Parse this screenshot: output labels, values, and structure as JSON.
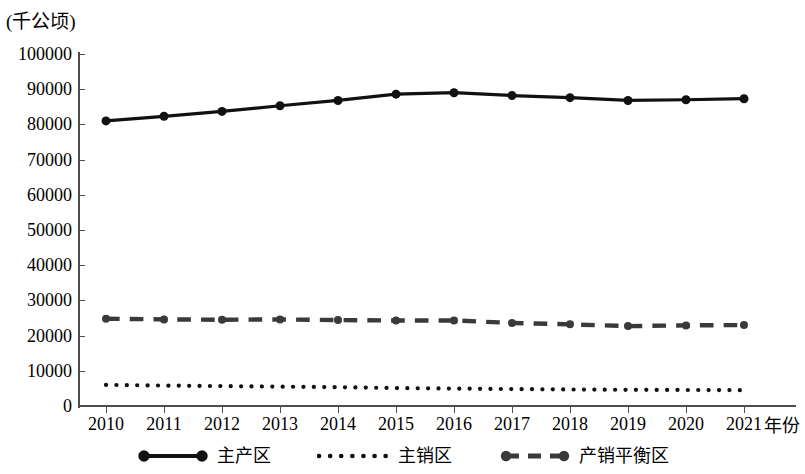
{
  "chart_data": {
    "type": "line",
    "title": "",
    "subtitle": "",
    "ylabel": "(千公顷)",
    "xlabel": "年份",
    "x": [
      2010,
      2011,
      2012,
      2013,
      2014,
      2015,
      2016,
      2017,
      2018,
      2019,
      2020,
      2021
    ],
    "categories": [
      "2010",
      "2011",
      "2012",
      "2013",
      "2014",
      "2015",
      "2016",
      "2017",
      "2018",
      "2019",
      "2020",
      "2021"
    ],
    "ylim": [
      0,
      100000
    ],
    "yticks": [
      0,
      10000,
      20000,
      30000,
      40000,
      50000,
      60000,
      70000,
      80000,
      90000,
      100000
    ],
    "ytick_labels": [
      "0",
      "10000",
      "20000",
      "30000",
      "40000",
      "50000",
      "60000",
      "70000",
      "80000",
      "90000",
      "100000"
    ],
    "grid": false,
    "legend_position": "bottom",
    "series": [
      {
        "name": "主产区",
        "style": "solid",
        "marker": "circle",
        "marker_size": 9,
        "color": "#111111",
        "values": [
          81000,
          82300,
          83700,
          85300,
          86800,
          88600,
          89000,
          88200,
          87600,
          86800,
          87000,
          87300
        ]
      },
      {
        "name": "主销区",
        "style": "dotted",
        "marker": "none",
        "marker_size": 0,
        "color": "#111111",
        "values": [
          6000,
          5800,
          5650,
          5500,
          5350,
          5100,
          4950,
          4800,
          4700,
          4600,
          4550,
          4500
        ]
      },
      {
        "name": "产销平衡区",
        "style": "dashed",
        "marker": "circle",
        "marker_size": 8,
        "color": "#3a3a3a",
        "values": [
          24800,
          24600,
          24500,
          24600,
          24400,
          24300,
          24300,
          23600,
          23200,
          22700,
          22900,
          23000
        ]
      }
    ]
  },
  "legend": {
    "items": [
      {
        "label": "主产区"
      },
      {
        "label": "主销区"
      },
      {
        "label": "产销平衡区"
      }
    ]
  },
  "axes": {
    "y_unit_caption": "(千公顷)",
    "x_axis_title": "年份"
  },
  "colors": {
    "axis": "#4d4d4d",
    "series_primary": "#111111",
    "series_tertiary": "#3a3a3a",
    "background": "#ffffff"
  }
}
